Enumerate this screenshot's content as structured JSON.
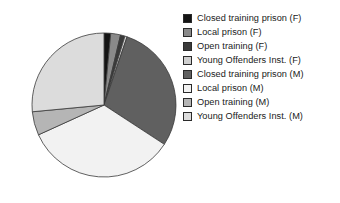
{
  "chart_data": {
    "type": "pie",
    "title": "",
    "subtitle": "",
    "xlabel": "",
    "ylabel": "",
    "grid": false,
    "legend_position": "right",
    "start_angle_deg": 0,
    "direction": "clockwise",
    "categories": [
      "Closed training prison (F)",
      "Local prison (F)",
      "Open training (F)",
      "Young Offenders Inst. (F)",
      "Closed training prison (M)",
      "Local prison (M)",
      "Open training (M)",
      "Young Offenders Inst. (M)"
    ],
    "values": [
      1.5,
      2.2,
      1.0,
      0.5,
      29.0,
      34.0,
      5.3,
      26.5
    ],
    "colors": [
      "#141414",
      "#8a8a8a",
      "#3a3a3a",
      "#cfcfcf",
      "#606060",
      "#f2f2f2",
      "#b5b5b5",
      "#dcdcdc"
    ],
    "edge_color": "#3a3a3a"
  },
  "legend": {
    "items": [
      {
        "label": "Closed training prison (F)",
        "swatch": "#141414",
        "icon": "legend-swatch-icon"
      },
      {
        "label": "Local prison (F)",
        "swatch": "#8a8a8a",
        "icon": "legend-swatch-icon"
      },
      {
        "label": "Open training (F)",
        "swatch": "#3a3a3a",
        "icon": "legend-swatch-icon"
      },
      {
        "label": "Young Offenders Inst. (F)",
        "swatch": "#cfcfcf",
        "icon": "legend-swatch-icon"
      },
      {
        "label": "Closed training prison (M)",
        "swatch": "#606060",
        "icon": "legend-swatch-icon"
      },
      {
        "label": "Local prison (M)",
        "swatch": "#f2f2f2",
        "icon": "legend-swatch-icon"
      },
      {
        "label": "Open training (M)",
        "swatch": "#b5b5b5",
        "icon": "legend-swatch-icon"
      },
      {
        "label": "Young Offenders Inst. (M)",
        "swatch": "#dcdcdc",
        "icon": "legend-swatch-icon"
      }
    ]
  },
  "geometry": {
    "center_x": 104,
    "center_y": 105,
    "radius": 72
  }
}
